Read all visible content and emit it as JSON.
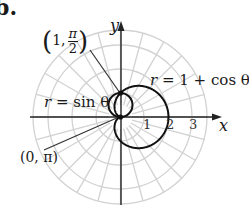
{
  "figure": {
    "part_label": "b.",
    "axes": {
      "x_label": "x",
      "y_label": "y",
      "x_ticks": [
        "1",
        "2",
        "3"
      ]
    },
    "curves": [
      {
        "name": "circle",
        "equation_lhs": "r",
        "equation_rhs": "sin θ",
        "full": "r = sin θ"
      },
      {
        "name": "cardioid",
        "equation_lhs": "r",
        "equation_rhs": "1 + cos θ",
        "full": "r = 1 + cos θ"
      }
    ],
    "intersection_points": [
      {
        "label_r": "1",
        "label_theta_num": "π",
        "label_theta_den": "2",
        "full": "(1, π/2)"
      },
      {
        "label": "(0, π)",
        "full": "(0, π)"
      }
    ],
    "grid": {
      "type": "polar",
      "radii": [
        1,
        2,
        3,
        3.6
      ],
      "angle_step_deg": 15
    },
    "colors": {
      "curve": "#111111",
      "axis": "#222222",
      "grid": "#cfcfcf",
      "background": "#ffffff"
    }
  },
  "chart_data": {
    "type": "polar-curves",
    "title": "",
    "series": [
      {
        "name": "r = sin θ",
        "kind": "circle",
        "center": [
          0,
          0.5
        ],
        "radius": 0.5
      },
      {
        "name": "r = 1 + cos θ",
        "kind": "cardioid",
        "max_x": 2
      }
    ],
    "annotations": [
      "(1, π/2)",
      "(0, π)"
    ],
    "x_ticks": [
      1,
      2,
      3
    ],
    "xlabel": "x",
    "ylabel": "y",
    "grid": true
  }
}
